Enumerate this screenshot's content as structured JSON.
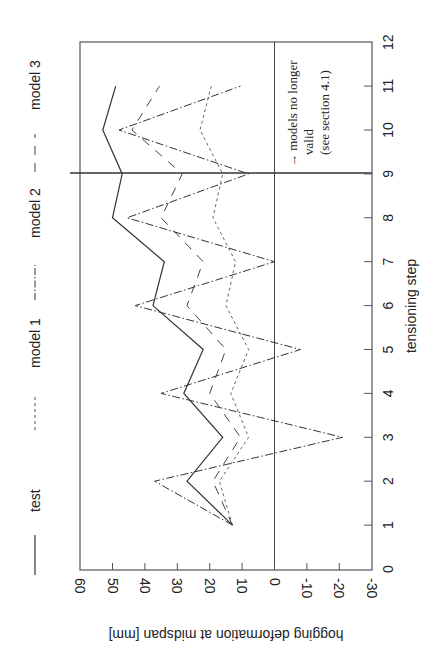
{
  "chart_data": {
    "type": "line",
    "orientation": "rotated-90-ccw",
    "title": "",
    "xlabel": "tensioning step",
    "ylabel": "hogging deformation at midspan [mm]",
    "x": [
      1,
      2,
      3,
      4,
      5,
      6,
      7,
      8,
      9,
      10,
      11
    ],
    "xlim": [
      0,
      12
    ],
    "ylim": [
      -30,
      60
    ],
    "x_ticks": [
      "0",
      "1",
      "2",
      "3",
      "4",
      "5",
      "6",
      "7",
      "8",
      "9",
      "10",
      "11",
      "12"
    ],
    "y_ticks": [
      "60",
      "50",
      "40",
      "30",
      "20",
      "10",
      "0",
      "-10",
      "-20",
      "-30"
    ],
    "grid": false,
    "legend_position": "top (left side of rotated page)",
    "series": [
      {
        "name": "test",
        "style": "solid",
        "values": [
          13,
          27,
          16,
          28,
          22,
          37.5,
          34,
          50,
          47,
          53,
          49
        ]
      },
      {
        "name": "model 1",
        "style": "short-dash",
        "values": [
          13,
          17,
          8,
          13.5,
          8,
          15,
          12,
          19,
          16,
          23,
          19.5
        ]
      },
      {
        "name": "model 2",
        "style": "dash-dot",
        "values": [
          13,
          37,
          -21,
          35,
          -8,
          43,
          0,
          45.5,
          8,
          48,
          10.5
        ]
      },
      {
        "name": "model 3",
        "style": "long-dash",
        "values": [
          13,
          19,
          10.5,
          20,
          15,
          27,
          22,
          35,
          28.5,
          44,
          35.5
        ]
      }
    ],
    "annotations": [
      {
        "text_line1": "→ models no longer",
        "text_line2": "valid",
        "text_line3": "(see section 4.1)",
        "at_step": 9
      }
    ],
    "reference_lines": [
      {
        "type": "zero-line",
        "value": 0
      },
      {
        "type": "step-line",
        "step": 9
      }
    ]
  },
  "legend": {
    "items": [
      {
        "label": "test"
      },
      {
        "label": "model 1"
      },
      {
        "label": "model 2"
      },
      {
        "label": "model 3"
      }
    ]
  },
  "axes": {
    "xlabel": "tensioning step",
    "ylabel": "hogging deformation at midspan [mm]"
  },
  "annotation": {
    "line1": "→ models no longer",
    "line2": "valid",
    "line3": "(see section 4.1)"
  }
}
